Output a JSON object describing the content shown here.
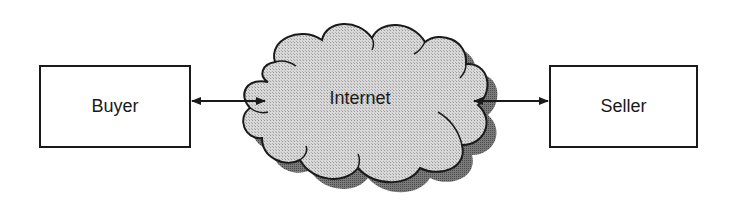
{
  "diagram": {
    "type": "network-flow",
    "nodes": {
      "buyer": {
        "label": "Buyer",
        "shape": "rectangle"
      },
      "internet": {
        "label": "Internet",
        "shape": "cloud"
      },
      "seller": {
        "label": "Seller",
        "shape": "rectangle"
      }
    },
    "edges": [
      {
        "from": "buyer",
        "to": "internet",
        "direction": "bidirectional"
      },
      {
        "from": "internet",
        "to": "seller",
        "direction": "bidirectional"
      }
    ],
    "colors": {
      "stroke": "#1a1a1a",
      "cloud_fill": "#d4d4d4",
      "cloud_shadow": "#6e6e6e",
      "box_fill": "#ffffff"
    }
  }
}
